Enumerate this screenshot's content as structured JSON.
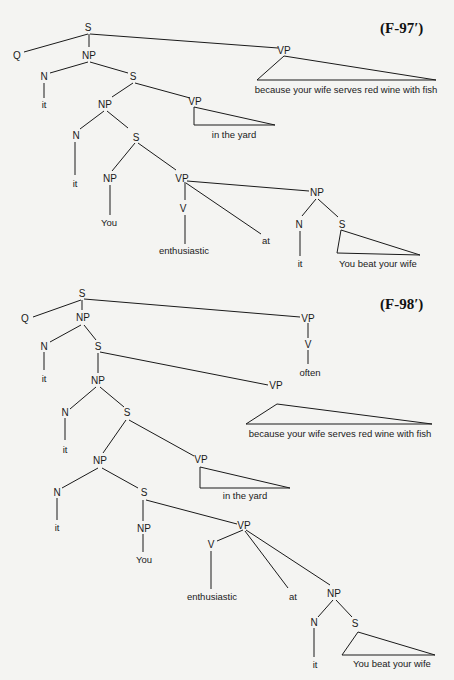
{
  "figures": [
    {
      "label": "(F-97′)",
      "nodes": {
        "root_s": "S",
        "q": "Q",
        "np1": "NP",
        "vp1": "VP",
        "vp1_text": "because your wife serves red wine with fish",
        "n1": "N",
        "n1_leaf": "it",
        "s2": "S",
        "np2": "NP",
        "vp2": "VP",
        "vp2_text": "in the yard",
        "n2": "N",
        "n2_leaf": "it",
        "s3": "S",
        "np3": "NP",
        "np3_leaf": "You",
        "vp3": "VP",
        "v": "V",
        "v_leaf": "enthusiastic",
        "at": "at",
        "np4": "NP",
        "n4": "N",
        "n4_leaf": "it",
        "s4": "S",
        "s4_text": "You beat your wife"
      }
    },
    {
      "label": "(F-98′)",
      "nodes": {
        "root_s": "S",
        "q": "Q",
        "np1": "NP",
        "vp0": "VP",
        "v0": "V",
        "v0_leaf": "often",
        "n1": "N",
        "n1_leaf": "it",
        "s2": "S",
        "np2": "NP",
        "vp1": "VP",
        "vp1_text": "because your wife serves red wine with fish",
        "n2": "N",
        "n2_leaf": "it",
        "s3": "S",
        "np3": "NP",
        "vp2": "VP",
        "vp2_text": "in the yard",
        "n3": "N",
        "n3_leaf": "it",
        "s4": "S",
        "np4": "NP",
        "np4_leaf": "You",
        "vp3": "VP",
        "v": "V",
        "v_leaf": "enthusiastic",
        "at": "at",
        "np5": "NP",
        "n5": "N",
        "n5_leaf": "it",
        "s5": "S",
        "s5_text": "You beat your wife"
      }
    }
  ]
}
